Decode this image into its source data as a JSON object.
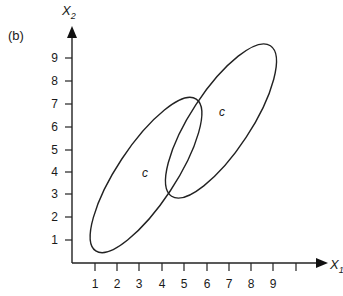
{
  "figure": {
    "panel_label": "(b)",
    "y_axis_label": "X",
    "y_axis_subscript": "2",
    "x_axis_label": "X",
    "x_axis_subscript": "1",
    "x_ticks": [
      "1",
      "2",
      "3",
      "4",
      "5",
      "6",
      "7",
      "8",
      "9"
    ],
    "y_ticks": [
      "1",
      "2",
      "3",
      "4",
      "5",
      "6",
      "7",
      "8",
      "9"
    ],
    "ellipses": [
      {
        "name": "lower-left-ellipse",
        "label": "c"
      },
      {
        "name": "upper-right-ellipse",
        "label": "c"
      }
    ],
    "line_color": "#222222"
  }
}
